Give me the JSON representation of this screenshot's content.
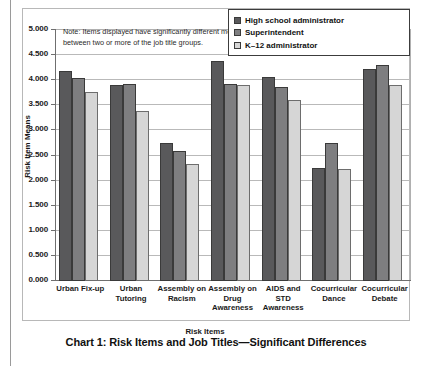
{
  "caption": "Chart 1: Risk Items and Job Titles—Significant Differences",
  "note": {
    "line1": "Note: Items displayed have significantly different means",
    "line2": "between two or more of the job title groups."
  },
  "colors": {
    "series0": "#59595b",
    "series1": "#7e7e80",
    "series2": "#d6d6d6",
    "grid": "#b9b9b9",
    "axis": "#6f6f6f"
  },
  "chart_data": {
    "type": "bar",
    "title": "Chart 1: Risk Items and Job Titles—Significant Differences",
    "xlabel": "Risk Items",
    "ylabel": "Risk Item Means",
    "ylim": [
      0,
      5
    ],
    "ytick_step": 0.5,
    "grid": true,
    "legend_position": "top-right",
    "yticks": [
      "0.000",
      "0.500",
      "1.000",
      "1.500",
      "2.000",
      "2.500",
      "3.000",
      "3.500",
      "4.000",
      "4.500",
      "5.000"
    ],
    "categories": [
      "Urban Fix-up",
      "Urban Tutoring",
      "Assembly on Racism",
      "Assembly on Drug Awareness",
      "AIDS and STD Awareness",
      "Cocurricular Dance",
      "Cocurricular Debate"
    ],
    "category_lines": [
      [
        "Urban Fix-up"
      ],
      [
        "Urban",
        "Tutoring"
      ],
      [
        "Assembly on",
        "Racism"
      ],
      [
        "Assembly on",
        "Drug",
        "Awareness"
      ],
      [
        "AIDS and",
        "STD",
        "Awareness"
      ],
      [
        "Cocurricular",
        "Dance"
      ],
      [
        "Cocurricular",
        "Debate"
      ]
    ],
    "series": [
      {
        "name": "High school administrator",
        "values": [
          4.19,
          3.9,
          2.74,
          4.38,
          4.06,
          2.26,
          4.23
        ]
      },
      {
        "name": "Superintendent",
        "values": [
          4.05,
          3.93,
          2.58,
          3.92,
          3.86,
          2.74,
          4.31
        ]
      },
      {
        "name": "K–12 administrator",
        "values": [
          3.76,
          3.39,
          2.34,
          3.91,
          3.61,
          2.23,
          3.91
        ]
      }
    ]
  }
}
